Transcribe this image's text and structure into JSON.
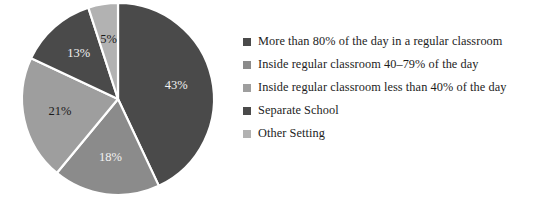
{
  "chart_data": {
    "type": "pie",
    "title": "",
    "subtitle": "",
    "xlabel": "",
    "ylabel": "",
    "grid": false,
    "legend_position": "right",
    "start_angle_deg": 0,
    "direction": "clockwise",
    "categories": [
      "More than 80% of the day in a regular classroom",
      "Inside regular classroom 40–79% of the day",
      "Inside regular classroom less than 40% of the day",
      "Separate School",
      "Other Setting"
    ],
    "values": [
      43,
      18,
      21,
      13,
      5
    ],
    "value_labels": [
      "43%",
      "18%",
      "21%",
      "13%",
      "5%"
    ],
    "colors": [
      "#4a4a4a",
      "#8b8b8b",
      "#9e9e9e",
      "#4a4a4a",
      "#b2b2b2"
    ],
    "label_colors": [
      "#f2f2f2",
      "#f2f2f2",
      "#1a1a1a",
      "#f2f2f2",
      "#1a1a1a"
    ],
    "slices": [
      {
        "label": "More than 80% of the day in a regular classroom",
        "value": 43,
        "display": "43%",
        "color": "#4a4a4a",
        "label_color": "#f2f2f2"
      },
      {
        "label": "Inside regular classroom 40–79% of the day",
        "value": 18,
        "display": "18%",
        "color": "#8b8b8b",
        "label_color": "#f2f2f2"
      },
      {
        "label": "Inside regular classroom less than 40% of the day",
        "value": 21,
        "display": "21%",
        "color": "#9e9e9e",
        "label_color": "#1a1a1a"
      },
      {
        "label": "Separate School",
        "value": 13,
        "display": "13%",
        "color": "#4a4a4a",
        "label_color": "#f2f2f2"
      },
      {
        "label": "Other Setting",
        "value": 5,
        "display": "5%",
        "color": "#b2b2b2",
        "label_color": "#1a1a1a"
      }
    ]
  },
  "legend": {
    "items": [
      {
        "label": "More than 80% of the day in a regular classroom",
        "color": "#4a4a4a"
      },
      {
        "label": "Inside regular classroom 40–79% of the day",
        "color": "#8b8b8b"
      },
      {
        "label": "Inside regular classroom less than 40% of the day",
        "color": "#9e9e9e"
      },
      {
        "label": "Separate School",
        "color": "#4a4a4a"
      },
      {
        "label": "Other Setting",
        "color": "#b2b2b2"
      }
    ]
  },
  "geometry": {
    "center_x": 118,
    "center_y": 99,
    "radius": 96,
    "label_radius_ratio": 0.62
  }
}
